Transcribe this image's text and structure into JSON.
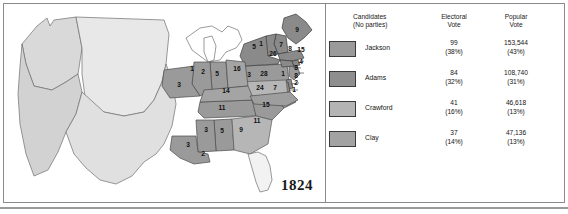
{
  "figure": {
    "year_label": "1824"
  },
  "legend": {
    "headers": {
      "candidates": "Candidates\n(No parties)",
      "electoral": "Electoral\nVote",
      "popular": "Popular\nVote"
    },
    "rows": [
      {
        "name": "Jackson",
        "swatch_color": "#9a9a9a",
        "electoral": "99\n(38%)",
        "popular": "153,544\n(43%)",
        "electoral_votes": 99,
        "electoral_pct": "38%",
        "popular_votes": "153,544",
        "popular_pct": "43%"
      },
      {
        "name": "Adams",
        "swatch_color": "#8e8e8e",
        "electoral": "84\n(32%)",
        "popular": "108,740\n(31%)",
        "electoral_votes": 84,
        "electoral_pct": "32%",
        "popular_votes": "108,740",
        "popular_pct": "31%"
      },
      {
        "name": "Crawford",
        "swatch_color": "#b4b4b4",
        "electoral": "41\n(16%)",
        "popular": "46,618\n(13%)",
        "electoral_votes": 41,
        "electoral_pct": "16%",
        "popular_votes": "46,618",
        "popular_pct": "13%"
      },
      {
        "name": "Clay",
        "swatch_color": "#a2a2a2",
        "electoral": "37\n(14%)",
        "popular": "47,136\n(13%)",
        "electoral_votes": 37,
        "electoral_pct": "14%",
        "popular_votes": "47,136",
        "popular_pct": "13%"
      }
    ]
  },
  "map": {
    "unshaded_territory_color": "#e2e2e2",
    "labels": [
      {
        "id": "maine",
        "text": "9",
        "x": 293,
        "y": 28
      },
      {
        "id": "new-hampshire",
        "text": "7",
        "x": 277,
        "y": 43
      },
      {
        "id": "vermont",
        "text": "5",
        "x": 250,
        "y": 45
      },
      {
        "id": "vermont-alt",
        "text": "1",
        "x": 257,
        "y": 42
      },
      {
        "id": "massachusetts",
        "text": "15",
        "x": 297,
        "y": 48
      },
      {
        "id": "new-york",
        "text": "26",
        "x": 269,
        "y": 52
      },
      {
        "id": "connecticut",
        "text": "8",
        "x": 286,
        "y": 47
      },
      {
        "id": "rhode-island",
        "text": "4",
        "x": 297,
        "y": 60
      },
      {
        "id": "new-jersey",
        "text": "8",
        "x": 292,
        "y": 66
      },
      {
        "id": "pennsylvania",
        "text": "28",
        "x": 260,
        "y": 72
      },
      {
        "id": "delaware",
        "text": "1",
        "x": 279,
        "y": 72
      },
      {
        "id": "maryland",
        "text": "8",
        "x": 292,
        "y": 74
      },
      {
        "id": "maryland-2",
        "text": "2",
        "x": 292,
        "y": 81
      },
      {
        "id": "maryland-3",
        "text": "1",
        "x": 290,
        "y": 88
      },
      {
        "id": "virginia",
        "text": "7",
        "x": 271,
        "y": 86
      },
      {
        "id": "ohio",
        "text": "16",
        "x": 233,
        "y": 67
      },
      {
        "id": "indiana",
        "text": "5",
        "x": 213,
        "y": 72
      },
      {
        "id": "illinois",
        "text": "2",
        "x": 199,
        "y": 70
      },
      {
        "id": "illinois-1",
        "text": "1",
        "x": 188,
        "y": 67
      },
      {
        "id": "missouri",
        "text": "3",
        "x": 175,
        "y": 83
      },
      {
        "id": "kentucky",
        "text": "14",
        "x": 222,
        "y": 89
      },
      {
        "id": "tennessee",
        "text": "11",
        "x": 218,
        "y": 106
      },
      {
        "id": "north-carolina",
        "text": "24",
        "x": 256,
        "y": 86
      },
      {
        "id": "south-carolina",
        "text": "15",
        "x": 262,
        "y": 103
      },
      {
        "id": "georgia",
        "text": "11",
        "x": 253,
        "y": 119
      },
      {
        "id": "alabama",
        "text": "5",
        "x": 218,
        "y": 129
      },
      {
        "id": "mississippi",
        "text": "3",
        "x": 202,
        "y": 128
      },
      {
        "id": "louisiana",
        "text": "3",
        "x": 184,
        "y": 143
      },
      {
        "id": "louisiana-2",
        "text": "2",
        "x": 199,
        "y": 152
      },
      {
        "id": "georgia-2",
        "text": "9",
        "x": 237,
        "y": 128
      },
      {
        "id": "virginia-w",
        "text": "3",
        "x": 245,
        "y": 73
      }
    ]
  }
}
